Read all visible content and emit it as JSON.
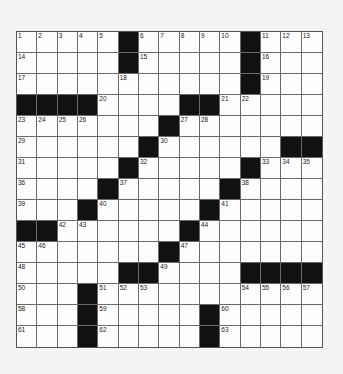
{
  "puzzle": {
    "size": {
      "rows": 15,
      "cols": 15
    },
    "colors": {
      "block": "#111111",
      "cell": "#fdfdfd",
      "line": "#6a6a6a",
      "background": "#f4f4f4"
    },
    "layout": [
      ".....#.....#...",
      ".....#.....#...",
      "...........#...",
      "####....##.....",
      ".......#.......",
      "......#......##",
      ".....#.....#...",
      "....#.....#....",
      "...#.....#.....",
      "##......#......",
      ".......#.......",
      ".....##....####",
      "...#...........",
      "...#.....#.....",
      "...#.....#....."
    ],
    "numbers": [
      {
        "r": 0,
        "c": 0,
        "n": "1"
      },
      {
        "r": 0,
        "c": 1,
        "n": "2"
      },
      {
        "r": 0,
        "c": 2,
        "n": "3"
      },
      {
        "r": 0,
        "c": 3,
        "n": "4"
      },
      {
        "r": 0,
        "c": 4,
        "n": "5"
      },
      {
        "r": 0,
        "c": 6,
        "n": "6"
      },
      {
        "r": 0,
        "c": 7,
        "n": "7"
      },
      {
        "r": 0,
        "c": 8,
        "n": "8"
      },
      {
        "r": 0,
        "c": 9,
        "n": "9"
      },
      {
        "r": 0,
        "c": 10,
        "n": "10"
      },
      {
        "r": 0,
        "c": 12,
        "n": "11"
      },
      {
        "r": 0,
        "c": 13,
        "n": "12"
      },
      {
        "r": 0,
        "c": 14,
        "n": "13"
      },
      {
        "r": 1,
        "c": 0,
        "n": "14"
      },
      {
        "r": 1,
        "c": 6,
        "n": "15"
      },
      {
        "r": 1,
        "c": 12,
        "n": "16"
      },
      {
        "r": 2,
        "c": 0,
        "n": "17"
      },
      {
        "r": 2,
        "c": 5,
        "n": "18"
      },
      {
        "r": 2,
        "c": 12,
        "n": "19"
      },
      {
        "r": 3,
        "c": 4,
        "n": "20"
      },
      {
        "r": 3,
        "c": 10,
        "n": "21"
      },
      {
        "r": 3,
        "c": 11,
        "n": "22"
      },
      {
        "r": 4,
        "c": 0,
        "n": "23"
      },
      {
        "r": 4,
        "c": 1,
        "n": "24"
      },
      {
        "r": 4,
        "c": 2,
        "n": "25"
      },
      {
        "r": 4,
        "c": 3,
        "n": "26"
      },
      {
        "r": 4,
        "c": 8,
        "n": "27"
      },
      {
        "r": 4,
        "c": 9,
        "n": "28"
      },
      {
        "r": 5,
        "c": 0,
        "n": "29"
      },
      {
        "r": 5,
        "c": 7,
        "n": "30"
      },
      {
        "r": 6,
        "c": 0,
        "n": "31"
      },
      {
        "r": 6,
        "c": 6,
        "n": "32"
      },
      {
        "r": 6,
        "c": 12,
        "n": "33"
      },
      {
        "r": 6,
        "c": 13,
        "n": "34"
      },
      {
        "r": 6,
        "c": 14,
        "n": "35"
      },
      {
        "r": 7,
        "c": 0,
        "n": "36"
      },
      {
        "r": 7,
        "c": 5,
        "n": "37"
      },
      {
        "r": 7,
        "c": 11,
        "n": "38"
      },
      {
        "r": 8,
        "c": 0,
        "n": "39"
      },
      {
        "r": 8,
        "c": 4,
        "n": "40"
      },
      {
        "r": 8,
        "c": 10,
        "n": "41"
      },
      {
        "r": 9,
        "c": 2,
        "n": "42"
      },
      {
        "r": 9,
        "c": 3,
        "n": "43"
      },
      {
        "r": 9,
        "c": 9,
        "n": "44"
      },
      {
        "r": 10,
        "c": 0,
        "n": "45"
      },
      {
        "r": 10,
        "c": 1,
        "n": "46"
      },
      {
        "r": 10,
        "c": 8,
        "n": "47"
      },
      {
        "r": 11,
        "c": 0,
        "n": "48"
      },
      {
        "r": 11,
        "c": 7,
        "n": "49"
      },
      {
        "r": 12,
        "c": 0,
        "n": "50"
      },
      {
        "r": 12,
        "c": 4,
        "n": "51"
      },
      {
        "r": 12,
        "c": 5,
        "n": "52"
      },
      {
        "r": 12,
        "c": 6,
        "n": "53"
      },
      {
        "r": 12,
        "c": 11,
        "n": "54"
      },
      {
        "r": 12,
        "c": 12,
        "n": "55"
      },
      {
        "r": 12,
        "c": 13,
        "n": "56"
      },
      {
        "r": 12,
        "c": 14,
        "n": "57"
      },
      {
        "r": 13,
        "c": 0,
        "n": "58"
      },
      {
        "r": 13,
        "c": 4,
        "n": "59"
      },
      {
        "r": 13,
        "c": 10,
        "n": "60"
      },
      {
        "r": 14,
        "c": 0,
        "n": "61"
      },
      {
        "r": 14,
        "c": 4,
        "n": "62"
      },
      {
        "r": 14,
        "c": 10,
        "n": "63"
      }
    ],
    "entries": {}
  }
}
